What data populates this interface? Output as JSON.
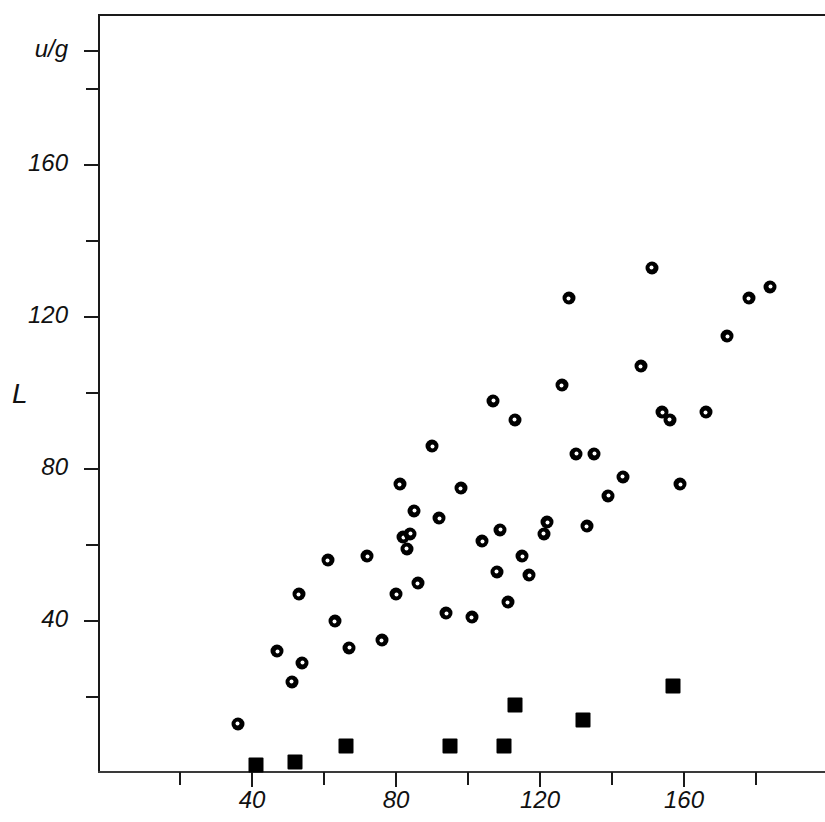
{
  "chart_data": {
    "type": "scatter",
    "title": "",
    "xlabel": "u/g",
    "ylabel": "L",
    "yunit": "u/g",
    "xlim": [
      19,
      221
    ],
    "ylim": [
      0,
      199.5
    ],
    "grid": false,
    "legend": "none",
    "x_ticks_major": [
      40,
      80,
      120,
      160
    ],
    "x_ticks_minor": [
      20,
      60,
      100,
      140,
      180,
      200
    ],
    "x_tick_labels": [
      "40",
      "80",
      "120",
      "160"
    ],
    "x_axis_unit_label": "u/g",
    "y_ticks_major": [
      40,
      80,
      120,
      160
    ],
    "y_ticks_minor": [
      20,
      60,
      100,
      140,
      180
    ],
    "y_tick_labels": [
      "40",
      "80",
      "120",
      "160"
    ],
    "y_axis_unit_label": "u/g",
    "marker_colors": {
      "circle": "#000000",
      "square": "#000000",
      "axis": "#1a1a1a",
      "background": "#ffffff"
    },
    "series": [
      {
        "name": "open-circles",
        "marker": "circle-with-white-center",
        "points": [
          [
            36,
            13
          ],
          [
            47,
            32
          ],
          [
            51,
            24
          ],
          [
            53,
            47
          ],
          [
            54,
            29
          ],
          [
            61,
            56
          ],
          [
            63,
            40
          ],
          [
            67,
            33
          ],
          [
            72,
            57
          ],
          [
            76,
            35
          ],
          [
            80,
            47
          ],
          [
            81,
            76
          ],
          [
            82,
            62
          ],
          [
            83,
            59
          ],
          [
            84,
            63
          ],
          [
            85,
            69
          ],
          [
            86,
            50
          ],
          [
            90,
            86
          ],
          [
            92,
            67
          ],
          [
            94,
            42
          ],
          [
            98,
            75
          ],
          [
            101,
            41
          ],
          [
            104,
            61
          ],
          [
            107,
            98
          ],
          [
            108,
            53
          ],
          [
            109,
            64
          ],
          [
            111,
            45
          ],
          [
            113,
            93
          ],
          [
            115,
            57
          ],
          [
            117,
            52
          ],
          [
            121,
            63
          ],
          [
            122,
            66
          ],
          [
            126,
            102
          ],
          [
            128,
            125
          ],
          [
            130,
            84
          ],
          [
            133,
            65
          ],
          [
            135,
            84
          ],
          [
            139,
            73
          ],
          [
            143,
            78
          ],
          [
            148,
            107
          ],
          [
            151,
            133
          ],
          [
            154,
            95
          ],
          [
            156,
            93
          ],
          [
            159,
            76
          ],
          [
            166,
            95
          ],
          [
            172,
            115
          ],
          [
            178,
            125
          ],
          [
            184,
            128
          ]
        ]
      },
      {
        "name": "filled-squares",
        "marker": "filled-square",
        "points": [
          [
            41,
            2
          ],
          [
            52,
            3
          ],
          [
            66,
            7
          ],
          [
            95,
            7
          ],
          [
            110,
            7
          ],
          [
            113,
            18
          ],
          [
            132,
            14
          ],
          [
            157,
            23
          ]
        ]
      }
    ]
  }
}
